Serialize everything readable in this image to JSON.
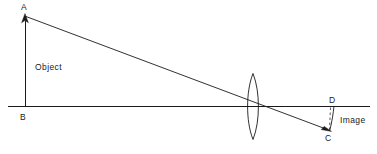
{
  "diagram": {
    "type": "optics-ray-diagram",
    "canvas": {
      "width": 377,
      "height": 154,
      "background": "#ffffff"
    },
    "stroke_color": "#1a1a1a",
    "labels": {
      "point_a": "A",
      "point_b": "B",
      "point_c": "C",
      "point_d": "D",
      "object": "Object",
      "image": "Image"
    },
    "elements": {
      "optical_axis": {
        "name": "optical-axis",
        "x1": 8,
        "y1": 106.5,
        "x2": 370,
        "y2": 106.5
      },
      "object_arrow": {
        "name": "object-arrow",
        "x1": 25,
        "y1": 106.5,
        "x2": 25,
        "y2": 14,
        "arrow_at": "top"
      },
      "principal_ray": {
        "name": "principal-ray",
        "x1": 26,
        "y1": 16,
        "x2": 331,
        "y2": 131,
        "arrow_at": "end"
      },
      "lens": {
        "name": "biconvex-lens",
        "cx": 253,
        "cy": 106.5,
        "half_width": 5.5,
        "half_height": 33
      },
      "image_dashed": {
        "name": "image-dashed-line",
        "x1": 331,
        "y1": 107,
        "x2": 330,
        "y2": 130
      },
      "image_arc": {
        "name": "image-curved-arrow",
        "from_x": 333,
        "from_y": 106,
        "to_x": 330,
        "to_y": 130
      }
    }
  }
}
